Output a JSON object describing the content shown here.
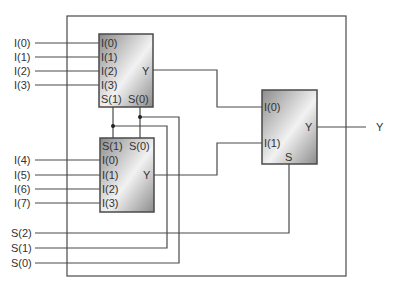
{
  "diagram": {
    "inputs": [
      "I(0)",
      "I(1)",
      "I(2)",
      "I(3)",
      "I(4)",
      "I(5)",
      "I(6)",
      "I(7)"
    ],
    "selects": [
      "S(2)",
      "S(1)",
      "S(0)"
    ],
    "output": "Y",
    "mux1": {
      "inputs": [
        "I(0)",
        "I(1)",
        "I(2)",
        "I(3)"
      ],
      "selects": [
        "S(1)",
        "S(0)"
      ],
      "output": "Y"
    },
    "mux2": {
      "inputs": [
        "I(0)",
        "I(1)",
        "I(2)",
        "I(3)"
      ],
      "selects": [
        "S(1)",
        "S(0)"
      ],
      "output": "Y"
    },
    "mux3": {
      "inputs": [
        "I(0)",
        "I(1)"
      ],
      "select": "S",
      "output": "Y"
    },
    "colors": {
      "wire": "#4a4a4a",
      "box_dark": "#8a8a8a",
      "box_light": "#f4f4f4"
    }
  }
}
